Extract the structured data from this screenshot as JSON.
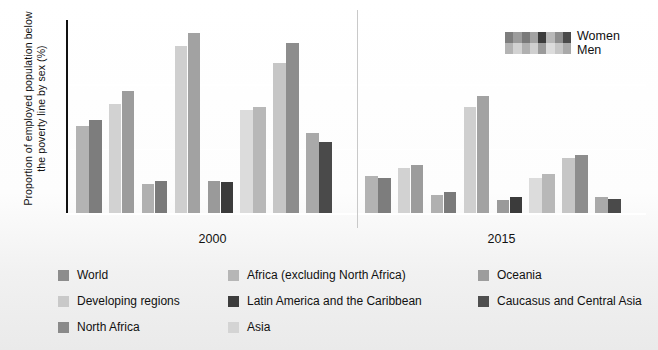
{
  "chart_data": {
    "type": "bar",
    "title": "",
    "xlabel": "",
    "ylabel": "Proportion of employed population below the poverty line by sex (%)",
    "ylim": [
      0,
      60
    ],
    "yticks": [
      0,
      20,
      40,
      60
    ],
    "grid": true,
    "legend_position": "bottom and top-right",
    "groups": [
      "2000",
      "2015"
    ],
    "categories": [
      "World",
      "Developing regions",
      "North Africa",
      "Africa (excluding North Africa)",
      "Latin America and the Caribbean",
      "Asia",
      "Oceania",
      "Caucasus and Central Asia"
    ],
    "series": [
      {
        "name": "Men",
        "shade": "light"
      },
      {
        "name": "Women",
        "shade": "dark"
      }
    ],
    "data": [
      {
        "group": "2000",
        "category": "World",
        "men": 27.0,
        "women": 29.0
      },
      {
        "group": "2000",
        "category": "Developing regions",
        "men": 34.0,
        "women": 38.0
      },
      {
        "group": "2000",
        "category": "North Africa",
        "men": 9.0,
        "women": 10.0
      },
      {
        "group": "2000",
        "category": "Africa (excluding North Africa)",
        "men": 52.0,
        "women": 56.0
      },
      {
        "group": "2000",
        "category": "Latin America and the Caribbean",
        "men": 10.0,
        "women": 9.5
      },
      {
        "group": "2000",
        "category": "Asia",
        "men": 32.0,
        "women": 33.0
      },
      {
        "group": "2000",
        "category": "Oceania",
        "men": 46.5,
        "women": 53.0
      },
      {
        "group": "2000",
        "category": "Caucasus and Central Asia",
        "men": 25.0,
        "women": 22.0
      },
      {
        "group": "2015",
        "category": "World",
        "men": 11.5,
        "women": 11.0
      },
      {
        "group": "2015",
        "category": "Developing regions",
        "men": 14.0,
        "women": 15.0
      },
      {
        "group": "2015",
        "category": "North Africa",
        "men": 5.5,
        "women": 6.5
      },
      {
        "group": "2015",
        "category": "Africa (excluding North Africa)",
        "men": 33.0,
        "women": 36.5
      },
      {
        "group": "2015",
        "category": "Latin America and the Caribbean",
        "men": 4.0,
        "women": 5.0
      },
      {
        "group": "2015",
        "category": "Asia",
        "men": 11.0,
        "women": 12.0
      },
      {
        "group": "2015",
        "category": "Oceania",
        "men": 17.0,
        "women": 18.0
      },
      {
        "group": "2015",
        "category": "Caucasus and Central Asia",
        "men": 5.0,
        "women": 4.5
      }
    ],
    "category_colors": {
      "World": {
        "men": "#b3b3b3",
        "women": "#7d7d7d"
      },
      "Developing regions": {
        "men": "#d2d2d2",
        "women": "#9c9c9c"
      },
      "North Africa": {
        "men": "#b0b0b0",
        "women": "#7a7a7a"
      },
      "Africa (excluding North Africa)": {
        "men": "#cfcfcf",
        "women": "#a2a2a2"
      },
      "Latin America and the Caribbean": {
        "men": "#9a9a9a",
        "women": "#3b3b3b"
      },
      "Asia": {
        "men": "#dcdcdc",
        "women": "#b8b8b8"
      },
      "Oceania": {
        "men": "#c6c6c6",
        "women": "#8d8d8d"
      },
      "Caucasus and Central Asia": {
        "men": "#a9a9a9",
        "women": "#4a4a4a"
      }
    }
  },
  "axis": {
    "y_title": "Proportion of employed population below the poverty line by sex (%)",
    "y_ticks": [
      "60",
      "40",
      "20",
      "0"
    ],
    "x_group_labels": [
      "2000",
      "2015"
    ]
  },
  "series_legend": {
    "women_label": "Women",
    "men_label": "Men"
  },
  "category_legend": {
    "items": [
      {
        "label": "World",
        "color": "#8d8d8d"
      },
      {
        "label": "Africa (excluding North Africa)",
        "color": "#b6b6b6"
      },
      {
        "label": "Oceania",
        "color": "#9d9d9d"
      },
      {
        "label": "Developing regions",
        "color": "#c9c9c9"
      },
      {
        "label": "Latin America and the Caribbean",
        "color": "#3d3d3d"
      },
      {
        "label": "Caucasus and Central Asia",
        "color": "#4f4f4f"
      },
      {
        "label": "North Africa",
        "color": "#8a8a8a"
      },
      {
        "label": "Asia",
        "color": "#d4d4d4"
      }
    ]
  }
}
